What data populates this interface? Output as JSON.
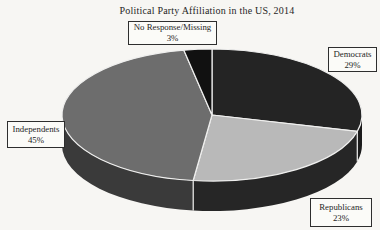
{
  "title": "Political Party Affiliation in the US, 2014",
  "chart_data": {
    "type": "pie",
    "projection": "3d-oblique",
    "title": "Political Party Affiliation in the US, 2014",
    "direction": "clockwise",
    "start_angle_deg": 0,
    "unit": "percent",
    "categories": [
      "Democrats",
      "Republicans",
      "Independents",
      "No Response/Missing"
    ],
    "values": [
      29,
      23,
      45,
      3
    ],
    "slices": [
      {
        "name": "Democrats",
        "value": 29,
        "color": "#242424",
        "side_color": "#1b1b1b"
      },
      {
        "name": "Republicans",
        "value": 23,
        "color": "#b9b9b9",
        "side_color": "#262626"
      },
      {
        "name": "Independents",
        "value": 45,
        "color": "#6d6d6d",
        "side_color": "#3a3a3a"
      },
      {
        "name": "No Response/Missing",
        "value": 3,
        "color": "#111111",
        "side_color": "#111111"
      }
    ],
    "outline_color": "#efefee",
    "legend": "none",
    "labels_style": "boxed callouts with category and percent"
  },
  "callouts": {
    "no_response": {
      "label": "No Response/Missing",
      "value": "3%"
    },
    "democrats": {
      "label": "Democrats",
      "value": "29%"
    },
    "independents": {
      "label": "Independents",
      "value": "45%"
    },
    "republicans": {
      "label": "Republicans",
      "value": "23%"
    }
  }
}
